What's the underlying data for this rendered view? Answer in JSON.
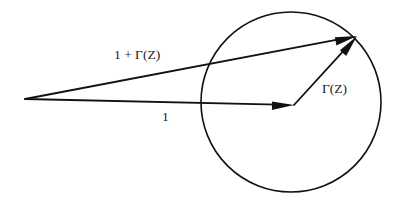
{
  "figure": {
    "background_color": "#ffffff",
    "ink_color": "#111111",
    "width": 408,
    "height": 214
  },
  "labels": {
    "sum_vector": "1 + Γ(Z)",
    "unit_vector": "1",
    "gamma_vector": "Γ(Z)"
  },
  "chart_data": {
    "type": "scatter",
    "xlabel": "",
    "ylabel": "",
    "grid": false,
    "legend": "none",
    "circle": {
      "name": "unit-circle",
      "center_x": 291,
      "center_y": 102,
      "radius": 90,
      "stroke_width": 1.6
    },
    "origin": {
      "name": "common-vertex",
      "x": 25,
      "y": 99
    },
    "vectors": [
      {
        "name": "sum-vector",
        "label": "1 + Γ(Z)",
        "from_x": 25,
        "from_y": 99,
        "to_x": 357,
        "to_y": 36,
        "stroke_width": 1.8
      },
      {
        "name": "unit-vector",
        "label": "1",
        "from_x": 25,
        "from_y": 99,
        "to_x": 294,
        "to_y": 105,
        "stroke_width": 1.8
      },
      {
        "name": "gamma-vector",
        "label": "Γ(Z)",
        "from_x": 294,
        "from_y": 105,
        "to_x": 357,
        "to_y": 36,
        "stroke_width": 1.8
      }
    ]
  }
}
